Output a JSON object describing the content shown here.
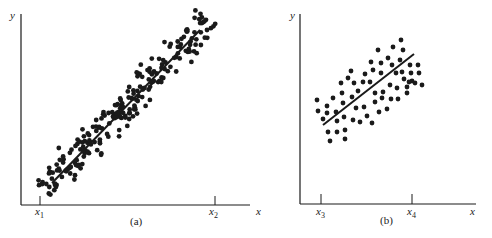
{
  "chart_data": [
    {
      "type": "scatter",
      "caption": "(a)",
      "xlabel": "x",
      "ylabel": "y",
      "ticks": [
        {
          "label": "x",
          "sub": "1",
          "px": 40
        },
        {
          "label": "x",
          "sub": "2",
          "px": 215
        }
      ],
      "regression_line": {
        "from": [
          52,
          183
        ],
        "to": [
          200,
          30
        ]
      },
      "description": "Tight scatter (~220 points) along an upward regression line between x1 and x2",
      "generate": {
        "count": 230,
        "t_range": [
          -0.05,
          1.08
        ],
        "spread": 11,
        "seed": 7
      },
      "grid": false,
      "axes": {
        "origin": [
          21,
          205
        ],
        "x_end": 250,
        "y_top": 14
      }
    },
    {
      "type": "scatter",
      "caption": "(b)",
      "xlabel": "x",
      "ylabel": "y",
      "ticks": [
        {
          "label": "x",
          "sub": "3",
          "px": 321
        },
        {
          "label": "x",
          "sub": "4",
          "px": 412
        }
      ],
      "regression_line": {
        "from": [
          323,
          125
        ],
        "to": [
          414,
          54
        ]
      },
      "description": "Wider scatter (~70 points) around an upward regression line between x3 and x4",
      "points": [
        [
          317,
          100
        ],
        [
          318,
          111
        ],
        [
          323,
          119
        ],
        [
          327,
          106
        ],
        [
          327,
          113
        ],
        [
          328,
          132
        ],
        [
          330,
          141
        ],
        [
          333,
          98
        ],
        [
          336,
          112
        ],
        [
          337,
          132
        ],
        [
          337,
          121
        ],
        [
          341,
          83
        ],
        [
          342,
          93
        ],
        [
          343,
          103
        ],
        [
          344,
          117
        ],
        [
          345,
          130
        ],
        [
          345,
          139
        ],
        [
          348,
          78
        ],
        [
          351,
          71
        ],
        [
          352,
          97
        ],
        [
          353,
          120
        ],
        [
          354,
          83
        ],
        [
          356,
          108
        ],
        [
          358,
          91
        ],
        [
          360,
          122
        ],
        [
          363,
          82
        ],
        [
          364,
          107
        ],
        [
          365,
          74
        ],
        [
          367,
          116
        ],
        [
          370,
          82
        ],
        [
          372,
          123
        ],
        [
          371,
          62
        ],
        [
          373,
          70
        ],
        [
          375,
          93
        ],
        [
          375,
          102
        ],
        [
          379,
          112
        ],
        [
          378,
          50
        ],
        [
          381,
          63
        ],
        [
          381,
          73
        ],
        [
          382,
          98
        ],
        [
          383,
          92
        ],
        [
          387,
          109
        ],
        [
          388,
          58
        ],
        [
          390,
          85
        ],
        [
          391,
          99
        ],
        [
          392,
          65
        ],
        [
          393,
          47
        ],
        [
          396,
          73
        ],
        [
          397,
          88
        ],
        [
          398,
          99
        ],
        [
          400,
          60
        ],
        [
          401,
          40
        ],
        [
          403,
          50
        ],
        [
          402,
          72
        ],
        [
          404,
          79
        ],
        [
          407,
          93
        ],
        [
          407,
          87
        ],
        [
          410,
          65
        ],
        [
          411,
          73
        ],
        [
          412,
          81
        ],
        [
          415,
          83
        ],
        [
          418,
          65
        ],
        [
          419,
          73
        ],
        [
          422,
          85
        ],
        [
          409,
          82
        ]
      ],
      "grid": false,
      "axes": {
        "origin": [
          300,
          204
        ],
        "x_end": 476,
        "y_top": 14
      }
    }
  ],
  "labels": {
    "a_caption": "(a)",
    "b_caption": "(b)",
    "a_y": "y",
    "a_x": "x",
    "b_y": "y",
    "b_x": "x",
    "x1": "x",
    "x1_sub": "1",
    "x2": "x",
    "x2_sub": "2",
    "x3": "x",
    "x3_sub": "3",
    "x4": "x",
    "x4_sub": "4"
  },
  "colors": {
    "ink": "#1a1a1a",
    "background": "#ffffff"
  }
}
